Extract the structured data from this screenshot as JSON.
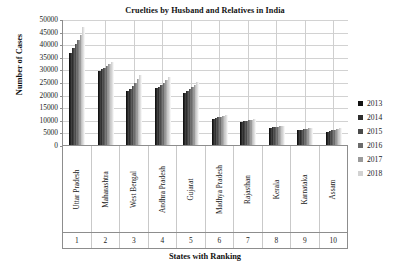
{
  "chart_data": {
    "type": "bar",
    "title": "Cruelties by Husband and Relatives in India",
    "xlabel": "States with Ranking",
    "ylabel": "Number of Cases",
    "ylim": [
      0,
      50000
    ],
    "ytick_step": 5000,
    "yticks": [
      "50000",
      "45000",
      "40000",
      "35000",
      "30000",
      "25000",
      "20000",
      "15000",
      "10000",
      "5000",
      "0"
    ],
    "grid": true,
    "legend_position": "right",
    "categories": [
      "Uttar Pradesh",
      "Maharashtra",
      "West Bengal",
      "Andhra Pradesh",
      "Gujarat",
      "Madhya Pradesh",
      "Rajasthan",
      "Kerala",
      "Karnataka",
      "Assam"
    ],
    "rankings": [
      "1",
      "2",
      "3",
      "4",
      "5",
      "6",
      "7",
      "8",
      "9",
      "10"
    ],
    "series": [
      {
        "name": "2013",
        "color": "#121212",
        "values": [
          36500,
          29400,
          21400,
          22700,
          20500,
          10500,
          9200,
          6800,
          5900,
          5200
        ]
      },
      {
        "name": "2014",
        "color": "#2e2e2e",
        "values": [
          38600,
          30000,
          22400,
          23200,
          21500,
          10800,
          9500,
          7000,
          6100,
          5500
        ]
      },
      {
        "name": "2015",
        "color": "#4a4a4a",
        "values": [
          40200,
          30600,
          23300,
          23900,
          22300,
          11000,
          9700,
          7100,
          6300,
          5800
        ]
      },
      {
        "name": "2016",
        "color": "#6b6b6b",
        "values": [
          41600,
          31300,
          24600,
          24700,
          23000,
          11200,
          9900,
          7300,
          6500,
          6100
        ]
      },
      {
        "name": "2017",
        "color": "#9a9a9a",
        "values": [
          43800,
          32000,
          26100,
          25800,
          23900,
          11500,
          10100,
          7500,
          6700,
          6400
        ]
      },
      {
        "name": "2018",
        "color": "#d2d2d2",
        "values": [
          47000,
          32900,
          27900,
          27100,
          24900,
          11800,
          10300,
          7700,
          6900,
          6700
        ]
      }
    ]
  },
  "legend": {
    "items": [
      {
        "label": "2013"
      },
      {
        "label": "2014"
      },
      {
        "label": "2015"
      },
      {
        "label": "2016"
      },
      {
        "label": "2017"
      },
      {
        "label": "2018"
      }
    ]
  }
}
